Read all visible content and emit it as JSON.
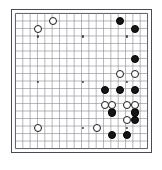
{
  "board": {
    "title": "Go board position",
    "size": 19,
    "style": {
      "line_color": "#8a8a93",
      "edge_line_color": "#5a5a63",
      "frame_color": "#4a4a52",
      "background_color": "#ffffff",
      "black_stone_color": "#151515",
      "white_stone_color": "#ffffff",
      "white_stone_border_color": "#1b1b1b",
      "hoshi_color": "#3c3c44"
    },
    "geometry": {
      "left": 11,
      "top": 9,
      "width": 141,
      "height": 144,
      "cell": 7.6,
      "margin": 3.5,
      "stone_diameter": 8.2
    },
    "hoshi_points": [
      {
        "col": 4,
        "row": 4
      },
      {
        "col": 10,
        "row": 4
      },
      {
        "col": 16,
        "row": 4
      },
      {
        "col": 4,
        "row": 10
      },
      {
        "col": 10,
        "row": 10
      },
      {
        "col": 16,
        "row": 10
      },
      {
        "col": 4,
        "row": 16
      },
      {
        "col": 10,
        "row": 16
      },
      {
        "col": 16,
        "row": 16
      }
    ],
    "stones": [
      {
        "color": "white",
        "col": 4,
        "row": 3,
        "label": "white-stone-d17"
      },
      {
        "color": "white",
        "col": 6,
        "row": 2,
        "label": "white-stone-f18"
      },
      {
        "color": "white",
        "col": 4,
        "row": 16,
        "label": "white-stone-d4"
      },
      {
        "color": "white",
        "col": 12,
        "row": 16,
        "label": "white-stone-m4"
      },
      {
        "color": "black",
        "col": 15,
        "row": 2,
        "label": "black-stone-p18"
      },
      {
        "color": "black",
        "col": 17,
        "row": 3,
        "label": "black-stone-r17"
      },
      {
        "color": "black",
        "col": 17,
        "row": 7,
        "label": "black-stone-r13"
      },
      {
        "color": "white",
        "col": 15,
        "row": 9,
        "label": "white-stone-p11"
      },
      {
        "color": "white",
        "col": 17,
        "row": 9,
        "label": "white-stone-r11"
      },
      {
        "color": "black",
        "col": 13,
        "row": 11,
        "label": "black-stone-n9"
      },
      {
        "color": "black",
        "col": 15,
        "row": 11,
        "label": "black-stone-p9"
      },
      {
        "color": "black",
        "col": 17,
        "row": 11,
        "label": "black-stone-r9"
      },
      {
        "color": "white",
        "col": 13,
        "row": 13,
        "label": "white-stone-n7"
      },
      {
        "color": "white",
        "col": 14,
        "row": 13,
        "label": "white-stone-o7"
      },
      {
        "color": "white",
        "col": 16,
        "row": 13,
        "label": "white-stone-q7"
      },
      {
        "color": "white",
        "col": 17,
        "row": 13,
        "label": "white-stone-r7"
      },
      {
        "color": "black",
        "col": 14,
        "row": 14,
        "label": "black-stone-o6"
      },
      {
        "color": "black",
        "col": 17,
        "row": 14,
        "label": "black-stone-r6"
      },
      {
        "color": "white",
        "col": 16,
        "row": 15,
        "label": "white-stone-q5"
      },
      {
        "color": "black",
        "col": 17,
        "row": 15,
        "label": "black-stone-r5"
      },
      {
        "color": "black",
        "col": 14,
        "row": 17,
        "label": "black-stone-o3"
      },
      {
        "color": "black",
        "col": 16,
        "row": 17,
        "label": "black-stone-q3"
      }
    ]
  }
}
